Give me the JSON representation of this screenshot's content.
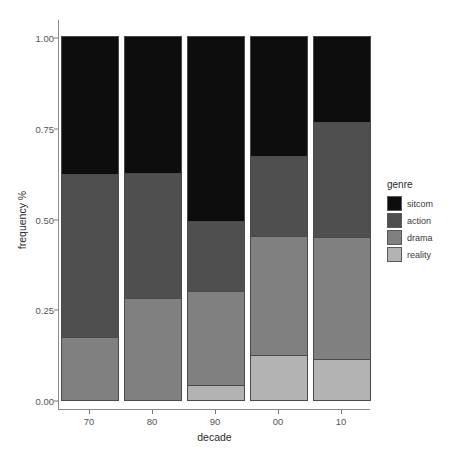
{
  "chart_data": {
    "type": "bar",
    "stacked": true,
    "stack_normalized": true,
    "title": "",
    "subtitle": "",
    "xlabel": "decade",
    "ylabel": "frequency %",
    "categories": [
      "70",
      "80",
      "90",
      "00",
      "10"
    ],
    "xtick_labels": [
      "70",
      "80",
      "90",
      "00",
      "10"
    ],
    "ytick_labels": [
      "0.00",
      "0.25",
      "0.50",
      "0.75",
      "1.00"
    ],
    "ytick_values": [
      0.0,
      0.25,
      0.5,
      0.75,
      1.0
    ],
    "ylim": [
      0.0,
      1.0
    ],
    "grid": false,
    "legend": {
      "title": "genre",
      "position": "right",
      "entries": [
        {
          "label": "sitcom",
          "color": "#0d0d0d"
        },
        {
          "label": "action",
          "color": "#4f4f4f"
        },
        {
          "label": "drama",
          "color": "#808080"
        },
        {
          "label": "reality",
          "color": "#b3b3b3"
        }
      ]
    },
    "series": [
      {
        "name": "sitcom",
        "color": "#0d0d0d",
        "values": [
          0.378,
          0.375,
          0.507,
          0.328,
          0.234
        ]
      },
      {
        "name": "action",
        "color": "#4f4f4f",
        "values": [
          0.448,
          0.344,
          0.193,
          0.22,
          0.317
        ]
      },
      {
        "name": "drama",
        "color": "#808080",
        "values": [
          0.174,
          0.281,
          0.259,
          0.328,
          0.336
        ]
      },
      {
        "name": "reality",
        "color": "#b3b3b3",
        "values": [
          0.0,
          0.0,
          0.041,
          0.124,
          0.113
        ]
      }
    ],
    "cumulative_tops": {
      "70": {
        "reality": 0.0,
        "drama": 0.174,
        "action": 0.622,
        "sitcom": 1.0
      },
      "80": {
        "reality": 0.0,
        "drama": 0.281,
        "action": 0.625,
        "sitcom": 1.0
      },
      "90": {
        "reality": 0.041,
        "drama": 0.3,
        "action": 0.493,
        "sitcom": 1.0
      },
      "00": {
        "reality": 0.124,
        "drama": 0.452,
        "action": 0.672,
        "sitcom": 1.0
      },
      "10": {
        "reality": 0.113,
        "drama": 0.449,
        "action": 0.766,
        "sitcom": 1.0
      }
    }
  },
  "axes": {
    "y_title": "frequency %",
    "x_title": "decade",
    "y_ticks": [
      {
        "label": "1.00",
        "value": 1.0
      },
      {
        "label": "0.75",
        "value": 0.75
      },
      {
        "label": "0.50",
        "value": 0.5
      },
      {
        "label": "0.25",
        "value": 0.25
      },
      {
        "label": "0.00",
        "value": 0.0
      }
    ],
    "x_ticks": [
      {
        "label": "70"
      },
      {
        "label": "80"
      },
      {
        "label": "90"
      },
      {
        "label": "00"
      },
      {
        "label": "10"
      }
    ]
  },
  "legend": {
    "title": "genre",
    "items": [
      {
        "label": "sitcom",
        "color": "#0d0d0d"
      },
      {
        "label": "action",
        "color": "#4f4f4f"
      },
      {
        "label": "drama",
        "color": "#808080"
      },
      {
        "label": "reality",
        "color": "#b3b3b3"
      }
    ]
  },
  "colors": {
    "background": "#ffffff",
    "axis": "#8a8a8a",
    "tick_text": "#555555",
    "title_text": "#2b2b2b",
    "bar_outline": "#4a4a4a"
  }
}
